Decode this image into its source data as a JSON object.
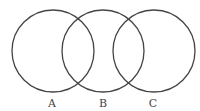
{
  "diagram": {
    "type": "venn",
    "stroke_color": "#444444",
    "circles": [
      {
        "label": "A",
        "cx": 53,
        "cy": 51,
        "r": 41
      },
      {
        "label": "B",
        "cx": 103,
        "cy": 51,
        "r": 41
      },
      {
        "label": "C",
        "cx": 154,
        "cy": 51,
        "r": 41
      }
    ]
  }
}
